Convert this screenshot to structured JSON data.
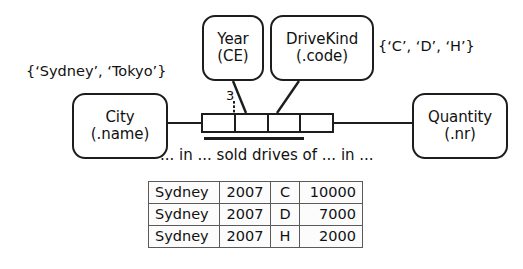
{
  "diagram": {
    "notation": "ORM",
    "object_types": [
      {
        "id": "city",
        "name": "City",
        "reference": "(.name)"
      },
      {
        "id": "year",
        "name": "Year",
        "reference": "(CE)"
      },
      {
        "id": "drivekind",
        "name": "DriveKind",
        "reference": "(.code)"
      },
      {
        "id": "quantity",
        "name": "Quantity",
        "reference": "(.nr)"
      }
    ],
    "value_constraints": [
      {
        "id": "city-values",
        "for": "City",
        "text": "{‘Sydney’, ‘Tokyo’}"
      },
      {
        "id": "drivekind-values",
        "for": "DriveKind",
        "text": "{‘C’, ‘D’, ‘H’}"
      }
    ],
    "fact_type": {
      "role_count": 4,
      "predicate_reading": "... in ... sold drives of ... in ...",
      "frequency_constraint": "3",
      "uniqueness_constraint_span": "roles 1-3"
    }
  },
  "fact_table": {
    "rows": [
      {
        "city": "Sydney",
        "year": "2007",
        "kind": "C",
        "quantity": "10000"
      },
      {
        "city": "Sydney",
        "year": "2007",
        "kind": "D",
        "quantity": "7000"
      },
      {
        "city": "Sydney",
        "year": "2007",
        "kind": "H",
        "quantity": "2000"
      }
    ]
  },
  "colors": {
    "stroke": "#1d1d1d",
    "table_border": "#5a5a5a",
    "background": "#ffffff"
  }
}
